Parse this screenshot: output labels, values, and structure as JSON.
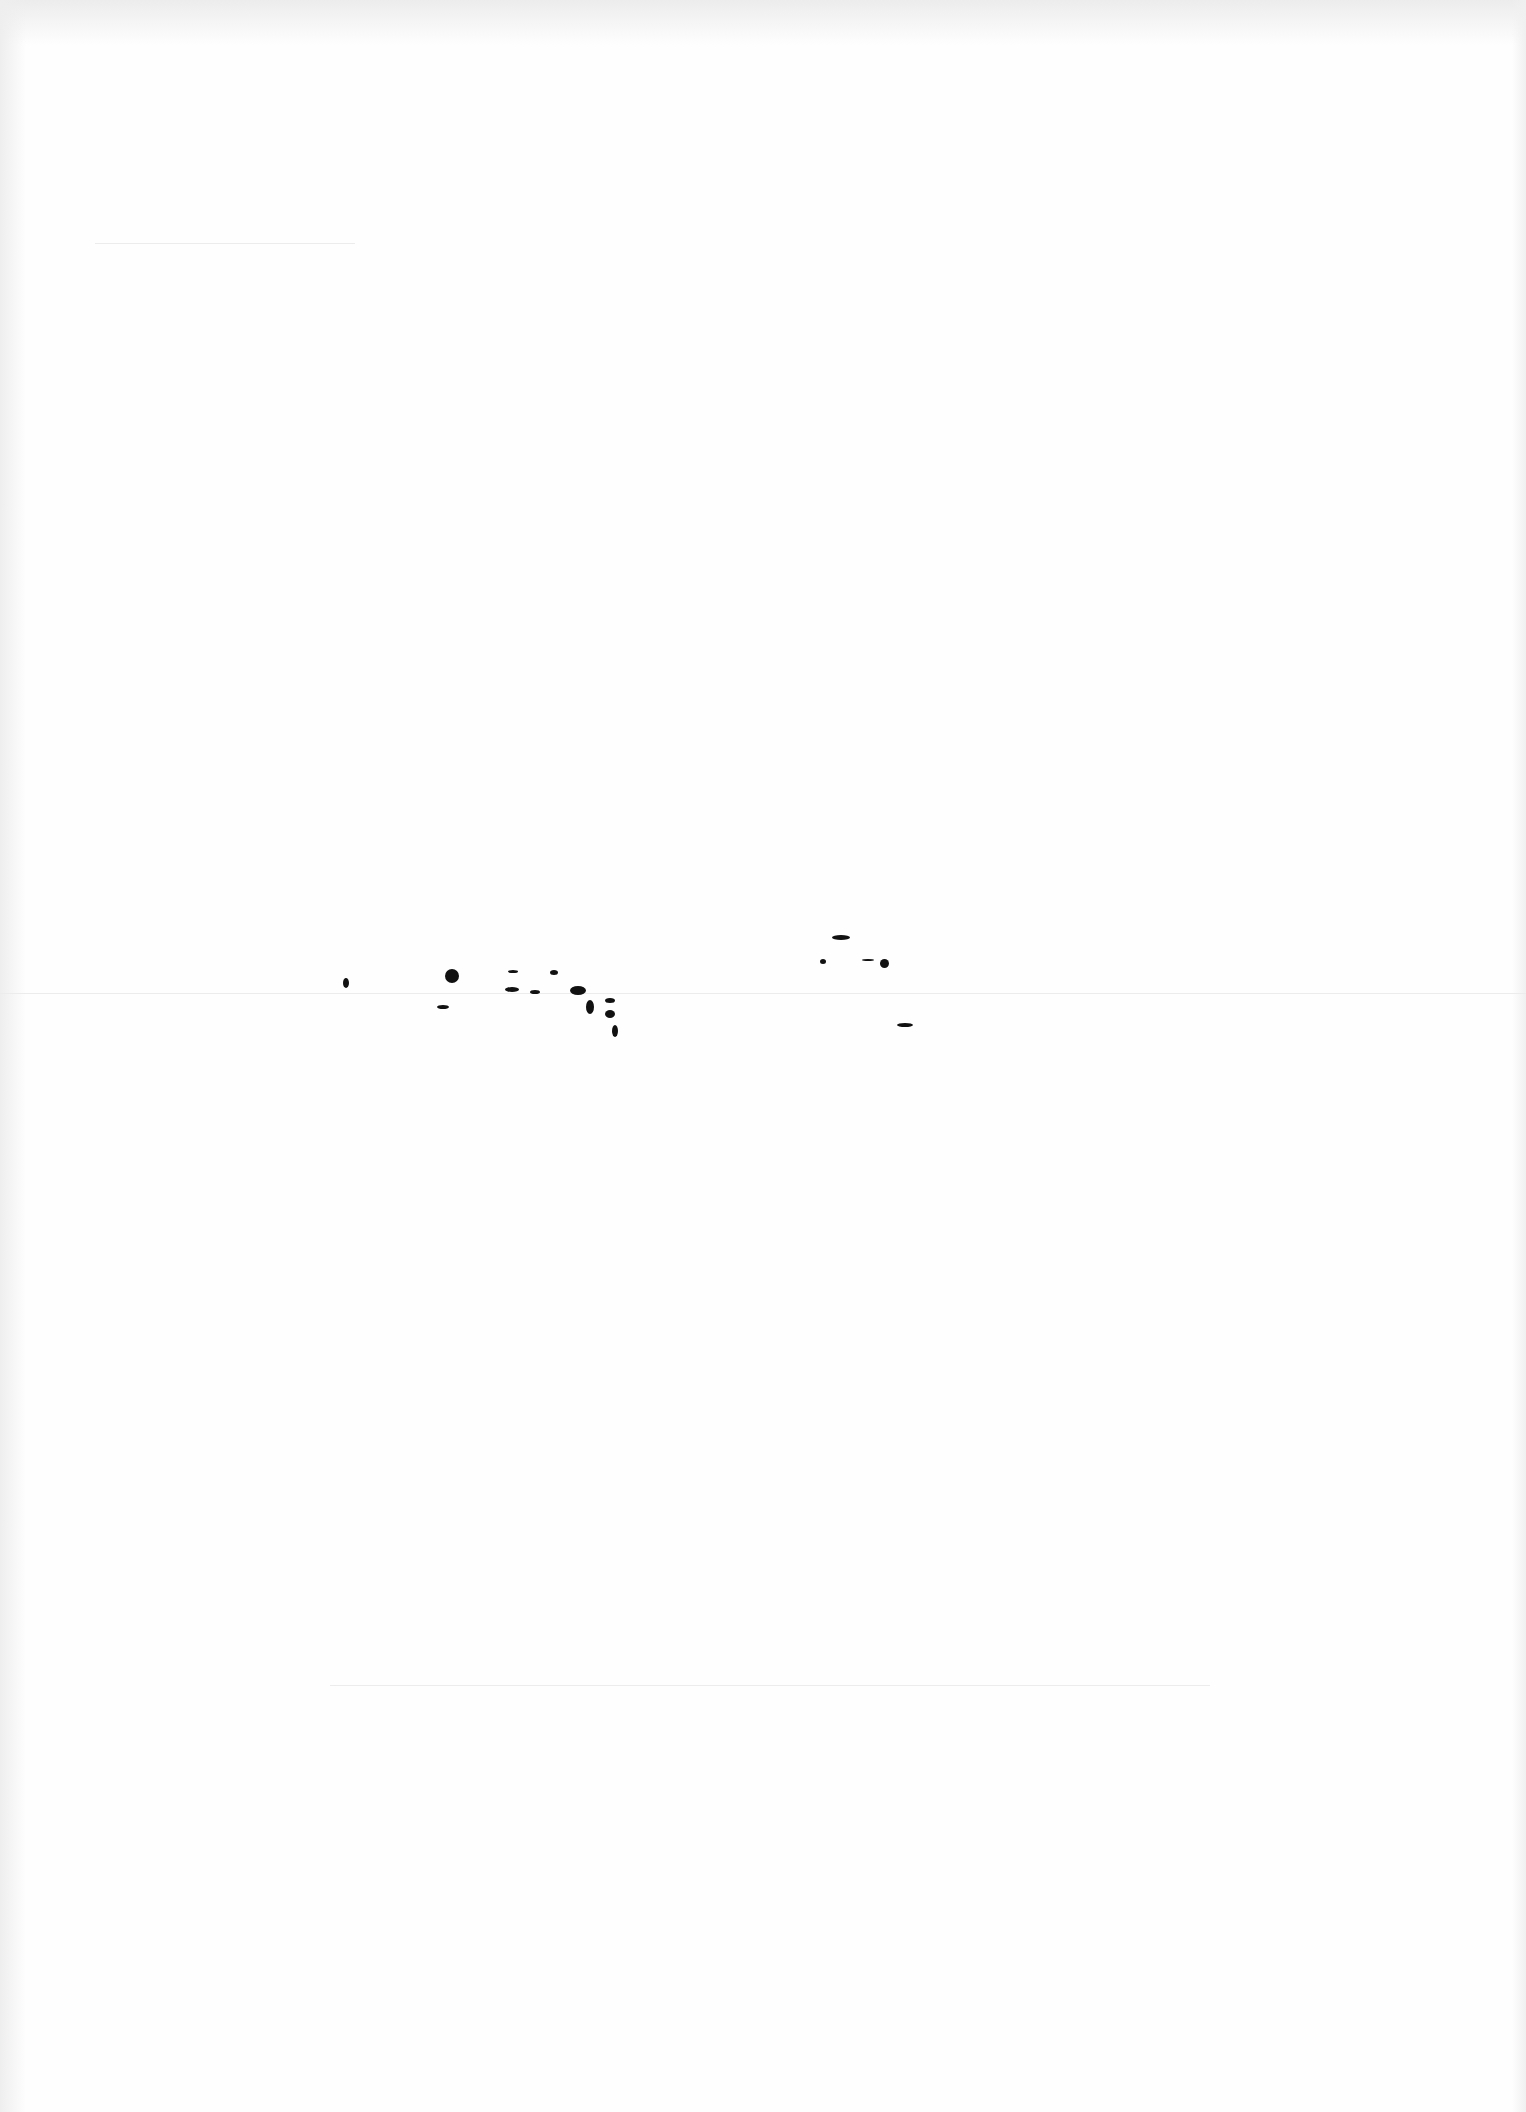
{
  "document": {
    "type": "blank scanned page",
    "text": "",
    "creases": [
      {
        "x": 95,
        "y": 243,
        "width": 260
      },
      {
        "x": 0,
        "y": 993,
        "width": 1526
      },
      {
        "x": 330,
        "y": 1685,
        "width": 880
      }
    ],
    "specks": [
      {
        "x": 343,
        "y": 978,
        "w": 6,
        "h": 10
      },
      {
        "x": 445,
        "y": 969,
        "w": 14,
        "h": 14
      },
      {
        "x": 437,
        "y": 1005,
        "w": 12,
        "h": 4
      },
      {
        "x": 508,
        "y": 970,
        "w": 10,
        "h": 3
      },
      {
        "x": 505,
        "y": 987,
        "w": 14,
        "h": 5
      },
      {
        "x": 530,
        "y": 990,
        "w": 10,
        "h": 4
      },
      {
        "x": 550,
        "y": 970,
        "w": 8,
        "h": 5
      },
      {
        "x": 570,
        "y": 986,
        "w": 16,
        "h": 9
      },
      {
        "x": 586,
        "y": 1000,
        "w": 8,
        "h": 14
      },
      {
        "x": 605,
        "y": 998,
        "w": 10,
        "h": 5
      },
      {
        "x": 605,
        "y": 1010,
        "w": 10,
        "h": 8
      },
      {
        "x": 612,
        "y": 1025,
        "w": 6,
        "h": 12
      },
      {
        "x": 832,
        "y": 935,
        "w": 18,
        "h": 5
      },
      {
        "x": 820,
        "y": 959,
        "w": 6,
        "h": 5
      },
      {
        "x": 862,
        "y": 959,
        "w": 12,
        "h": 2
      },
      {
        "x": 880,
        "y": 959,
        "w": 9,
        "h": 9
      },
      {
        "x": 897,
        "y": 1023,
        "w": 16,
        "h": 4
      }
    ]
  }
}
